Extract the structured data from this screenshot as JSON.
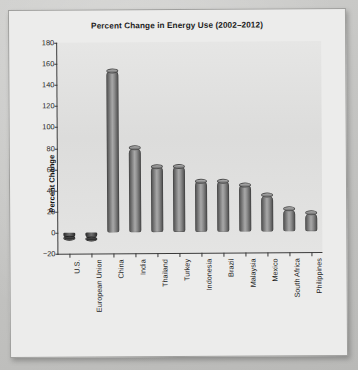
{
  "chart_data": {
    "type": "bar",
    "title": "Percent Change in Energy Use (2002–2012)",
    "xlabel": "",
    "ylabel": "Percent Change",
    "categories": [
      "U.S.",
      "European Union",
      "China",
      "India",
      "Thailand",
      "Turkey",
      "Indonesia",
      "Brazil",
      "Malaysia",
      "Mexico",
      "South Africa",
      "Philippines"
    ],
    "values": [
      -5,
      -6,
      153,
      80,
      62,
      62,
      48,
      48,
      44,
      34,
      21,
      17
    ],
    "ylim": [
      -20,
      180
    ],
    "ytick_step": 20,
    "yticks": [
      180,
      160,
      140,
      120,
      100,
      80,
      60,
      40,
      20,
      0,
      -20
    ],
    "ytick_labels": [
      "180",
      "160",
      "140",
      "120",
      "100",
      "80",
      "60",
      "40",
      "20",
      "0",
      "−20"
    ],
    "grid": false,
    "legend": "none",
    "bar_style": "cylinder",
    "colors": {
      "bar_fill": "#8a8a8a",
      "bar_edge": "#484848",
      "plot_background": "#e1e1e0",
      "card_background": "#ececeb",
      "page_background": "#c5c5c3",
      "axis": "#3a3a3a",
      "text": "#1b1b1b"
    }
  }
}
